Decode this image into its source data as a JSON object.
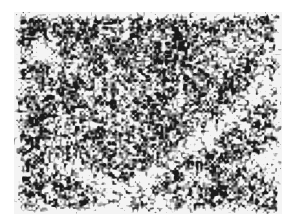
{
  "image": {
    "kind": "grayscale micrograph-like texture",
    "background": "#ffffff",
    "region": {
      "x": 14,
      "y": 12,
      "width": 268,
      "height": 202
    },
    "palette": {
      "dark": "#1a1a1a",
      "mid": "#7a7a7a",
      "light": "#f4f4f4"
    },
    "features": [
      {
        "type": "light-streak",
        "x1": 90,
        "y1": 200,
        "x2": 260,
        "y2": 70,
        "width": 10
      },
      {
        "type": "light-streak",
        "x1": 40,
        "y1": 150,
        "x2": 150,
        "y2": 190,
        "width": 8
      },
      {
        "type": "light-patch",
        "x": 210,
        "y": 40,
        "r": 14
      },
      {
        "type": "light-patch",
        "x": 30,
        "y": 40,
        "r": 12
      },
      {
        "type": "light-patch",
        "x": 250,
        "y": 150,
        "r": 12
      }
    ],
    "edge_fade": 8,
    "seed": 7
  }
}
